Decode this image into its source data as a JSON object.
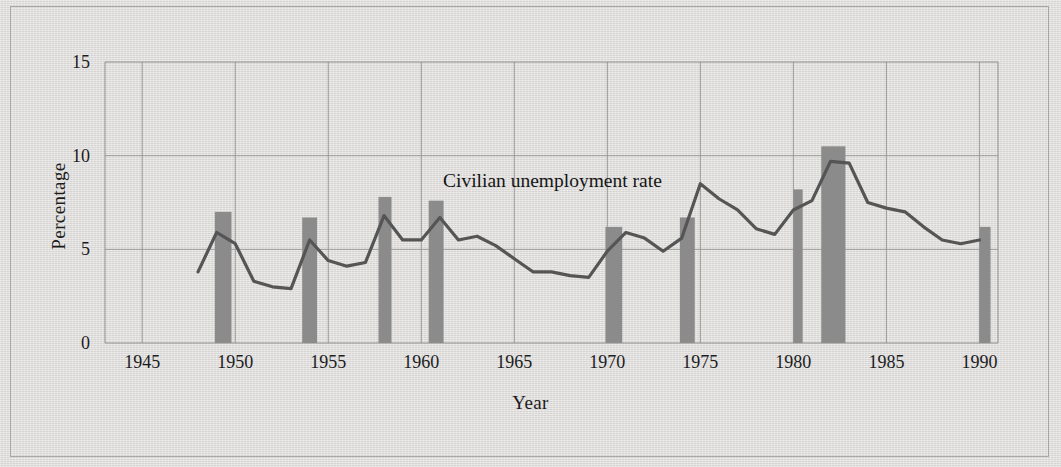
{
  "figure": {
    "background_color": "#dddcda",
    "border_color": "#a8a8a6",
    "annotation": "Civilian unemployment rate"
  },
  "axes": {
    "xlabel": "Year",
    "ylabel": "Percentage",
    "xticks": [
      "1945",
      "1950",
      "1955",
      "1960",
      "1965",
      "1970",
      "1975",
      "1980",
      "1985",
      "1990"
    ],
    "yticks": [
      "0",
      "5",
      "10",
      "15"
    ]
  },
  "chart_data": {
    "type": "line",
    "title": "",
    "subtitle": "",
    "xlabel": "Year",
    "ylabel": "Percentage",
    "annotations": [
      {
        "text": "Civilian unemployment rate",
        "x": 1962,
        "y": 9.2
      }
    ],
    "grid": true,
    "legend": "none",
    "xlim": [
      1943,
      1991
    ],
    "ylim": [
      0,
      15
    ],
    "xticks": [
      1945,
      1950,
      1955,
      1960,
      1965,
      1970,
      1975,
      1980,
      1985,
      1990
    ],
    "yticks": [
      0,
      5,
      10,
      15
    ],
    "line_color": "#555555",
    "bar_color": "#8b8b8b",
    "series": [
      {
        "name": "Civilian unemployment rate",
        "x": [
          1948,
          1949,
          1950,
          1951,
          1952,
          1953,
          1954,
          1955,
          1956,
          1957,
          1958,
          1959,
          1960,
          1961,
          1962,
          1963,
          1964,
          1965,
          1966,
          1967,
          1968,
          1969,
          1970,
          1971,
          1972,
          1973,
          1974,
          1975,
          1976,
          1977,
          1978,
          1979,
          1980,
          1981,
          1982,
          1983,
          1984,
          1985,
          1986,
          1987,
          1988,
          1989,
          1990
        ],
        "values": [
          3.8,
          5.9,
          5.3,
          3.3,
          3.0,
          2.9,
          5.5,
          4.4,
          4.1,
          4.3,
          6.8,
          5.5,
          5.5,
          6.7,
          5.5,
          5.7,
          5.2,
          4.5,
          3.8,
          3.8,
          3.6,
          3.5,
          4.9,
          5.9,
          5.6,
          4.9,
          5.6,
          8.5,
          7.7,
          7.1,
          6.1,
          5.8,
          7.1,
          7.6,
          9.7,
          9.6,
          7.5,
          7.2,
          7.0,
          6.2,
          5.5,
          5.3,
          5.5
        ]
      }
    ],
    "recession_bars": [
      {
        "label": "1949",
        "start": 1948.9,
        "end": 1949.8,
        "top": 7.0
      },
      {
        "label": "1954",
        "start": 1953.6,
        "end": 1954.4,
        "top": 6.7
      },
      {
        "label": "1958",
        "start": 1957.7,
        "end": 1958.4,
        "top": 7.8
      },
      {
        "label": "1960-61",
        "start": 1960.4,
        "end": 1961.2,
        "top": 7.6
      },
      {
        "label": "1970",
        "start": 1969.9,
        "end": 1970.8,
        "top": 6.2
      },
      {
        "label": "1974-75",
        "start": 1973.9,
        "end": 1974.7,
        "top": 6.7
      },
      {
        "label": "1980",
        "start": 1980.0,
        "end": 1980.5,
        "top": 8.2
      },
      {
        "label": "1981-82",
        "start": 1981.5,
        "end": 1982.8,
        "top": 10.5
      },
      {
        "label": "1990",
        "start": 1990.0,
        "end": 1990.6,
        "top": 6.2
      }
    ]
  }
}
